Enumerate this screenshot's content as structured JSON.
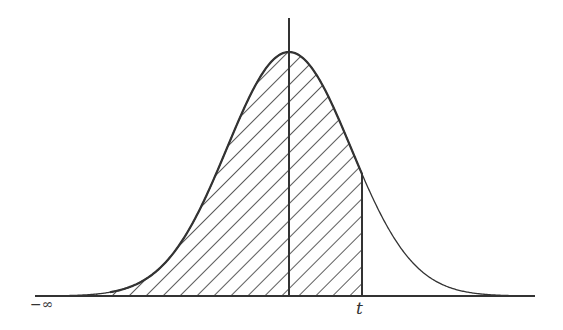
{
  "diagram": {
    "type": "normal-distribution-cdf-shading",
    "labels": {
      "neg_infinity": "−∞",
      "t": "t"
    },
    "shaded_region": "from −∞ to t (cumulative area)",
    "colors": {
      "line": "#333333",
      "background": "#ffffff"
    }
  }
}
